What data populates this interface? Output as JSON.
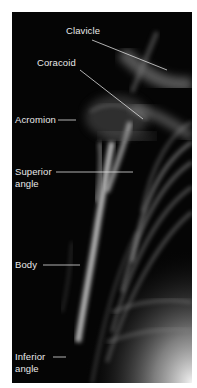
{
  "figure": {
    "colors": {
      "background": "#050505",
      "label": "#e8e8e8",
      "leader": "#dddddd",
      "page": "#ffffff"
    }
  },
  "labels": [
    {
      "id": "clavicle",
      "text": "Clavicle"
    },
    {
      "id": "coracoid",
      "text": "Coracoid"
    },
    {
      "id": "acromion",
      "text": "Acromion"
    },
    {
      "id": "superior-angle",
      "line1": "Superior",
      "line2": "angle"
    },
    {
      "id": "body",
      "text": "Body"
    },
    {
      "id": "inferior-angle",
      "line1": "Inferior",
      "line2": "angle"
    }
  ]
}
